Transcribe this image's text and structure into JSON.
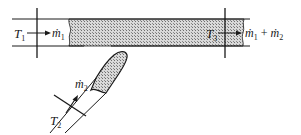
{
  "diagram": {
    "type": "mixing-tee",
    "inlet1": {
      "temperature_label": "T",
      "temperature_sub": "1",
      "flow_label": "ṁ",
      "flow_sub": "1"
    },
    "inlet2": {
      "temperature_label": "T",
      "temperature_sub": "2",
      "flow_label": "ṁ",
      "flow_sub": "2"
    },
    "outlet": {
      "temperature_label": "T",
      "temperature_sub": "3",
      "flow_label_a": "ṁ",
      "flow_sub_a": "1",
      "plus": "+",
      "flow_label_b": "ṁ",
      "flow_sub_b": "2"
    },
    "colors": {
      "line": "#1a1a1a",
      "hatch_fill": "#bdbdbd"
    }
  }
}
